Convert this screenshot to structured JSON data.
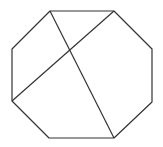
{
  "diagram": {
    "type": "geometry",
    "shape": "octagon",
    "stroke_color": "#333333",
    "background_color": "#ffffff",
    "stroke_width": 1.2,
    "vertices": [
      [
        50,
        11
      ],
      [
        114,
        11
      ],
      [
        152,
        49
      ],
      [
        152,
        102
      ],
      [
        114,
        138
      ],
      [
        49,
        138
      ],
      [
        12,
        101
      ],
      [
        12,
        49
      ]
    ],
    "diagonals": [
      {
        "from": [
          50,
          11
        ],
        "to": [
          114,
          138
        ]
      },
      {
        "from": [
          114,
          11
        ],
        "to": [
          12,
          101
        ]
      }
    ]
  }
}
